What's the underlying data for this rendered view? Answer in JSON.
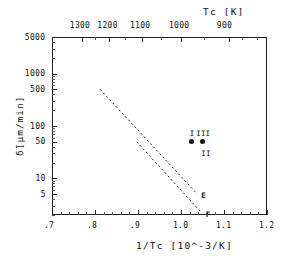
{
  "chart_data": {
    "type": "scatter",
    "title": "",
    "xlabel": "1/Tc [10^-3/K]",
    "ylabel": "δ̇[μm/min]",
    "top_axis_label": "Tc  [K]",
    "xlim": [
      0.7,
      1.2
    ],
    "ylim": [
      2,
      5000
    ],
    "yscale": "log",
    "grid": false,
    "xticks": [
      ".7",
      ".8",
      ".9",
      "1.0",
      "1.1",
      "1.2"
    ],
    "xtick_values": [
      0.7,
      0.8,
      0.9,
      1.0,
      1.1,
      1.2
    ],
    "yticks": [
      "5000",
      "1000",
      "500",
      "100",
      "50",
      "10",
      "5"
    ],
    "ytick_values": [
      5000,
      1000,
      500,
      100,
      50,
      10,
      5
    ],
    "top_ticks": [
      "1300",
      "1200",
      "1100",
      "1000",
      "900"
    ],
    "top_tick_values": [
      1300,
      1200,
      1100,
      1000,
      900
    ],
    "points": [
      {
        "label": "I",
        "x": 1.025,
        "y": 50,
        "label_pos": "above"
      },
      {
        "label": "III",
        "x": 1.05,
        "y": 50,
        "label_pos": "above"
      },
      {
        "label": "II",
        "x": 1.05,
        "y": 50,
        "label_pos": "below"
      }
    ],
    "series": [
      {
        "name": "E",
        "style": "dashed",
        "x": [
          0.812,
          1.038
        ],
        "y": [
          500,
          5.0
        ],
        "end_label": "E"
      },
      {
        "name": "F",
        "style": "dashed",
        "x": [
          0.897,
          1.048
        ],
        "y": [
          50,
          2.2
        ],
        "end_label": "F"
      }
    ],
    "legend": "none",
    "annotations": [
      {
        "text": "E",
        "x": 1.045,
        "y": 5.0
      },
      {
        "text": "F",
        "x": 1.055,
        "y": 2.2
      }
    ]
  }
}
